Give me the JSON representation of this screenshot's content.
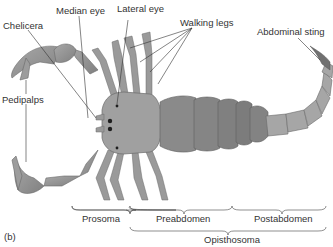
{
  "figure": {
    "panel_label": "(b)",
    "labels": {
      "chelicera": "Chelicera",
      "median_eye": "Median eye",
      "lateral_eye": "Lateral eye",
      "walking_legs": "Walking legs",
      "abdominal_sting": "Abdominal sting",
      "pedipalps": "Pedipalps"
    },
    "regions": {
      "prosoma": "Prosoma",
      "preabdomen": "Preabdomen",
      "postabdomen": "Postabdomen",
      "opisthosoma": "Opisthosoma"
    },
    "colors": {
      "body": "#8a8a8a",
      "body_light": "#a9a9a9",
      "body_dark": "#6e6e6e",
      "outline": "#5a5a5a",
      "leader_line": "#333333",
      "text": "#333333"
    }
  }
}
